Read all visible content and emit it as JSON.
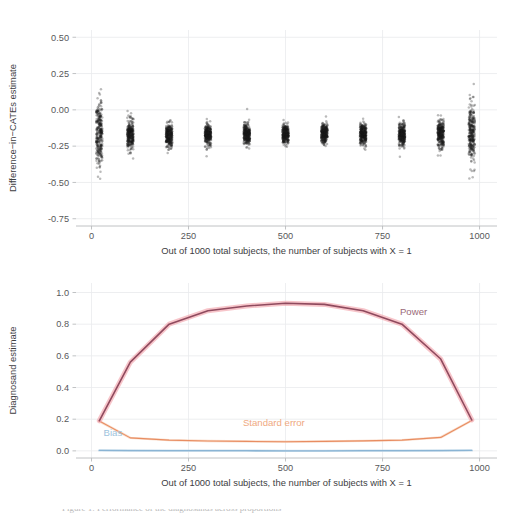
{
  "figure": {
    "background_color": "#ffffff",
    "grid_color": "#e8eaec",
    "axis_line_color": "#b9bbbd",
    "text_color": "#57585a"
  },
  "caption": {
    "partial_text": "Figure 1: Performance of the diagnosands across proportions"
  },
  "chart_data": [
    {
      "id": "difference-in-cates-scatter",
      "type": "scatter",
      "title": "",
      "xlabel": "Out of 1000 total subjects, the number of subjects with X = 1",
      "ylabel": "Difference−in−CATEs estimate",
      "xlim": [
        -40,
        1045
      ],
      "ylim": [
        -0.8,
        0.55
      ],
      "xticks": [
        0,
        250,
        500,
        750,
        1000
      ],
      "xticklabels": [
        "0",
        "250",
        "500",
        "750",
        "1000"
      ],
      "yticks": [
        0.5,
        0.25,
        0.0,
        -0.25,
        -0.5,
        -0.75
      ],
      "yticklabels": [
        "0.50",
        "0.25",
        "0.00",
        "-0.25",
        "-0.50",
        "-0.75"
      ],
      "grid": true,
      "point_color": "#1c1c1c",
      "point_opacity": 0.3,
      "point_radius": 1.25,
      "groups": [
        {
          "x": 20,
          "n": 300,
          "center": -0.17,
          "spread": 0.205,
          "outlier_spread": 0.3
        },
        {
          "x": 100,
          "n": 300,
          "center": -0.175,
          "spread": 0.085,
          "outlier_spread": 0.135
        },
        {
          "x": 200,
          "n": 300,
          "center": -0.175,
          "spread": 0.068,
          "outlier_spread": 0.105
        },
        {
          "x": 300,
          "n": 300,
          "center": -0.168,
          "spread": 0.062,
          "outlier_spread": 0.095
        },
        {
          "x": 400,
          "n": 300,
          "center": -0.168,
          "spread": 0.058,
          "outlier_spread": 0.092
        },
        {
          "x": 500,
          "n": 300,
          "center": -0.165,
          "spread": 0.056,
          "outlier_spread": 0.09
        },
        {
          "x": 600,
          "n": 300,
          "center": -0.165,
          "spread": 0.058,
          "outlier_spread": 0.092
        },
        {
          "x": 700,
          "n": 300,
          "center": -0.17,
          "spread": 0.062,
          "outlier_spread": 0.098
        },
        {
          "x": 800,
          "n": 300,
          "center": -0.172,
          "spread": 0.07,
          "outlier_spread": 0.112
        },
        {
          "x": 900,
          "n": 300,
          "center": -0.168,
          "spread": 0.088,
          "outlier_spread": 0.145
        },
        {
          "x": 980,
          "n": 300,
          "center": -0.165,
          "spread": 0.175,
          "outlier_spread": 0.265
        }
      ]
    },
    {
      "id": "diagnosand-estimates",
      "type": "line",
      "title": "",
      "xlabel": "Out of 1000 total subjects, the number of subjects with X = 1",
      "ylabel": "Diagnosand estimate",
      "xlim": [
        -40,
        1045
      ],
      "ylim": [
        -0.045,
        1.06
      ],
      "xticks": [
        0,
        250,
        500,
        750,
        1000
      ],
      "xticklabels": [
        "0",
        "250",
        "500",
        "750",
        "1000"
      ],
      "yticks": [
        1.0,
        0.8,
        0.6,
        0.4,
        0.2,
        0.0
      ],
      "yticklabels": [
        "1.0",
        "0.8",
        "0.6",
        "0.4",
        "0.2",
        "0.0"
      ],
      "grid": true,
      "x": [
        20,
        100,
        200,
        300,
        400,
        500,
        600,
        700,
        800,
        900,
        980
      ],
      "series": [
        {
          "name": "Power",
          "color": "#8f4a5e",
          "band_color": "#f2a6ad",
          "band_width": 5,
          "line_width": 1.6,
          "values": [
            0.19,
            0.56,
            0.8,
            0.885,
            0.915,
            0.932,
            0.925,
            0.885,
            0.8,
            0.58,
            0.195
          ],
          "label": "Power",
          "label_x": 830,
          "label_y": 0.855,
          "label_color": "#9a6a78"
        },
        {
          "name": "Standard error",
          "color": "#e88d62",
          "band_color": "#f6c9ad",
          "band_width": 2.4,
          "line_width": 1.1,
          "values": [
            0.188,
            0.082,
            0.068,
            0.062,
            0.06,
            0.058,
            0.06,
            0.063,
            0.068,
            0.085,
            0.192
          ],
          "label": "Standard error",
          "label_x": 470,
          "label_y": 0.155,
          "label_color": "#efa97f"
        },
        {
          "name": "Bias",
          "color": "#8ab4d4",
          "band_color": "#b9d4e6",
          "band_width": 2.4,
          "line_width": 1.3,
          "values": [
            0.003,
            0.002,
            0.001,
            0.001,
            0.001,
            0.0,
            0.0,
            0.001,
            0.001,
            0.002,
            0.003
          ],
          "label": "Bias",
          "label_x": 55,
          "label_y": 0.095,
          "label_color": "#9dc3dd"
        }
      ]
    }
  ]
}
